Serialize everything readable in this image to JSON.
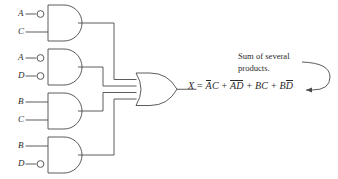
{
  "diagram": {
    "line_color": "#4a4a4a",
    "text_color": "#2b2b2b",
    "background": "#ffffff",
    "gates": [
      {
        "id": "and-gate-1",
        "type": "AND",
        "inputs": [
          {
            "label": "A",
            "inverted": true
          },
          {
            "label": "C",
            "inverted": false
          }
        ],
        "product": "A-bar C"
      },
      {
        "id": "and-gate-2",
        "type": "AND",
        "inputs": [
          {
            "label": "A",
            "inverted": true
          },
          {
            "label": "D",
            "inverted": true
          }
        ],
        "product": "A-bar D-bar"
      },
      {
        "id": "and-gate-3",
        "type": "AND",
        "inputs": [
          {
            "label": "B",
            "inverted": false
          },
          {
            "label": "C",
            "inverted": false
          }
        ],
        "product": "B C"
      },
      {
        "id": "and-gate-4",
        "type": "AND",
        "inputs": [
          {
            "label": "B",
            "inverted": false
          },
          {
            "label": "D",
            "inverted": true
          }
        ],
        "product": "B D-bar"
      }
    ],
    "or_gate": {
      "id": "or-gate",
      "type": "OR",
      "input_count": 4
    },
    "inputs": {
      "g1_a": "A",
      "g1_c": "C",
      "g2_a": "A",
      "g2_d": "D",
      "g3_b": "B",
      "g3_c": "C",
      "g4_b": "B",
      "g4_d": "D"
    },
    "equation": {
      "output": "X",
      "equals": "=",
      "plus1": "+",
      "plus2": "+",
      "plus3": "+",
      "term1": {
        "a": "A",
        "b": "C"
      },
      "term2": {
        "a": "A",
        "b": "D"
      },
      "term3": {
        "a": "B",
        "b": "C"
      },
      "term4": {
        "a": "B",
        "b": "D"
      },
      "full_text": "X = ĀC + ĀD̄ + BC + BD̄"
    },
    "annotation": {
      "line1": "Sum of several",
      "line2": "products."
    }
  }
}
